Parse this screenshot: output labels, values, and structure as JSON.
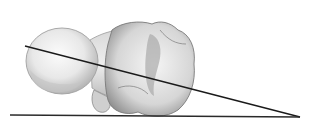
{
  "figure": {
    "colors": {
      "background": "#ffffff",
      "line": "#1a1a1a",
      "bone_light": "#eeeeee",
      "bone_mid": "#cfcfcf",
      "bone_dark": "#9a9a9a"
    }
  }
}
